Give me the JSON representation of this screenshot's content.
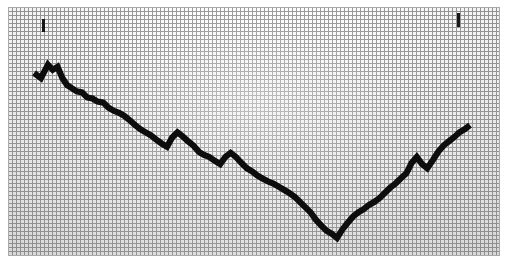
{
  "page": {
    "width": 509,
    "height": 268,
    "background_color": "#ffffff"
  },
  "plot": {
    "left": 8,
    "top": 7,
    "width": 492,
    "height": 249,
    "grid_cell_px": 4,
    "grid_line_color": "#8e8e8e",
    "paper_color": "#eeeeee",
    "border_color": "#a9a9a9",
    "line_color": "#0d0d0d",
    "line_width_px": 6
  },
  "markers": [
    {
      "name": "left-peak-tick",
      "x": 34,
      "y": 12,
      "width": 3,
      "height": 13
    },
    {
      "name": "right-peak-tick",
      "x": 449,
      "y": 6,
      "width": 3,
      "height": 14
    }
  ],
  "chart_data": {
    "type": "line",
    "title": "",
    "subtitle": "",
    "xlabel": "",
    "ylabel": "",
    "grid": true,
    "legend": null,
    "axis_ticks_visible": false,
    "tick_labels": {
      "x": [],
      "y": []
    },
    "xlim": [
      0,
      100
    ],
    "ylim": [
      0,
      100
    ],
    "series": [
      {
        "name": "series-1",
        "color": "#0d0d0d",
        "x": [
          0.0,
          1.6,
          3.2,
          4.3,
          5.4,
          6.5,
          7.6,
          8.7,
          9.8,
          11.0,
          12.2,
          13.4,
          14.6,
          15.9,
          17.1,
          18.3,
          19.5,
          20.7,
          21.9,
          23.2,
          24.4,
          25.6,
          26.8,
          28.0,
          29.3,
          30.5,
          31.7,
          32.9,
          34.1,
          35.4,
          36.6,
          37.8,
          39.0,
          40.2,
          41.5,
          42.7,
          43.9,
          45.1,
          46.3,
          47.6,
          48.8,
          50.0,
          51.2,
          52.4,
          53.7,
          54.9,
          56.1,
          57.3,
          58.5,
          59.8,
          61.0,
          62.2,
          63.4,
          64.6,
          65.9,
          67.1,
          68.3,
          69.5,
          70.7,
          72.0,
          73.2,
          74.4,
          75.6,
          76.8,
          78.0,
          79.3,
          80.5,
          81.7,
          82.9,
          84.1,
          85.4,
          86.6,
          87.8,
          89.0,
          90.2,
          91.5,
          92.7,
          93.9,
          95.1,
          96.3,
          97.6,
          98.8,
          100.0
        ],
        "y": [
          82.5,
          80.0,
          86.5,
          84.0,
          85.5,
          80.0,
          76.5,
          75.0,
          73.5,
          73.0,
          70.5,
          70.0,
          68.5,
          68.0,
          65.5,
          64.0,
          63.0,
          61.5,
          59.5,
          57.0,
          55.0,
          53.5,
          52.0,
          50.0,
          48.0,
          46.5,
          51.0,
          53.5,
          51.5,
          49.0,
          47.0,
          44.0,
          42.5,
          41.5,
          39.5,
          38.0,
          41.5,
          43.5,
          41.5,
          38.5,
          36.0,
          34.5,
          32.5,
          31.0,
          29.5,
          28.5,
          27.0,
          25.5,
          24.0,
          22.0,
          19.5,
          17.0,
          14.5,
          11.0,
          8.0,
          5.5,
          4.0,
          2.0,
          6.0,
          9.5,
          12.5,
          14.5,
          16.0,
          18.0,
          19.5,
          21.5,
          24.0,
          26.5,
          28.5,
          31.0,
          33.5,
          38.5,
          41.5,
          38.0,
          36.0,
          40.0,
          44.0,
          47.0,
          49.0,
          51.0,
          53.5,
          55.0,
          57.0
        ],
        "notes": "Values are normalized 0-100 read from the plotted pixel trace"
      }
    ],
    "annotations": [
      {
        "label": "",
        "type": "tick-mark",
        "x": 5.3,
        "y": 96.0
      },
      {
        "label": "",
        "type": "tick-mark",
        "x": 89.6,
        "y": 98.5
      }
    ]
  }
}
